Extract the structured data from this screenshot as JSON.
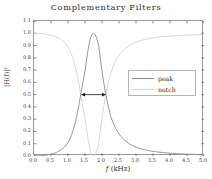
{
  "chart_data": {
    "type": "line",
    "title": "Complementary Filters",
    "xlabel_italic": "f",
    "xlabel_rest": " (kHz)",
    "xlabel": "f (kHz)",
    "ylabel": "|H(f)|²",
    "xlim": [
      0.0,
      5.0
    ],
    "ylim": [
      0.0,
      1.1
    ],
    "grid": false,
    "legend_position": "center right",
    "xticks": [
      "0.0",
      "0.5",
      "1.0",
      "1.5",
      "2.0",
      "2.5",
      "3.0",
      "3.5",
      "4.0",
      "4.5",
      "5.0"
    ],
    "xtick_values": [
      0.0,
      0.5,
      1.0,
      1.5,
      2.0,
      2.5,
      3.0,
      3.5,
      4.0,
      4.5,
      5.0
    ],
    "yticks": [
      "0.0",
      "0.1",
      "0.2",
      "0.3",
      "0.4",
      "0.5",
      "0.6",
      "0.7",
      "0.8",
      "0.9",
      "1.0",
      "1.1"
    ],
    "ytick_values": [
      0.0,
      0.1,
      0.2,
      0.3,
      0.4,
      0.5,
      0.6,
      0.7,
      0.8,
      0.9,
      1.0,
      1.1
    ],
    "center_frequency": 1.75,
    "bandwidth": 0.5,
    "annotation": {
      "label": "bandwidth-arrow",
      "y": 0.5,
      "x_start": 1.5,
      "x_end": 2.0,
      "style": "double-headed-arrow",
      "color": "#1a1a1a"
    },
    "series": [
      {
        "name": "peak",
        "color": "#8c8c8c",
        "x": [
          0.0,
          0.1,
          0.2,
          0.3,
          0.4,
          0.5,
          0.6,
          0.7,
          0.8,
          0.9,
          1.0,
          1.05,
          1.1,
          1.15,
          1.2,
          1.25,
          1.3,
          1.35,
          1.4,
          1.45,
          1.5,
          1.55,
          1.6,
          1.65,
          1.7,
          1.75,
          1.8,
          1.85,
          1.9,
          1.95,
          2.0,
          2.05,
          2.1,
          2.15,
          2.2,
          2.25,
          2.3,
          2.35,
          2.4,
          2.5,
          2.6,
          2.7,
          2.8,
          2.9,
          3.0,
          3.2,
          3.4,
          3.6,
          3.8,
          4.0,
          4.25,
          4.5,
          4.75,
          5.0
        ],
        "values": [
          0.0,
          0.001,
          0.002,
          0.005,
          0.009,
          0.015,
          0.023,
          0.035,
          0.051,
          0.074,
          0.111,
          0.136,
          0.168,
          0.208,
          0.257,
          0.316,
          0.385,
          0.461,
          0.542,
          0.62,
          0.69,
          0.79,
          0.88,
          0.95,
          0.99,
          1.0,
          0.99,
          0.955,
          0.9,
          0.8,
          0.69,
          0.6,
          0.52,
          0.45,
          0.385,
          0.33,
          0.29,
          0.255,
          0.225,
          0.18,
          0.145,
          0.12,
          0.1,
          0.085,
          0.072,
          0.054,
          0.042,
          0.034,
          0.028,
          0.023,
          0.018,
          0.015,
          0.012,
          0.01
        ]
      },
      {
        "name": "notch",
        "color": "#d2d2d2",
        "x": [
          0.0,
          0.1,
          0.2,
          0.3,
          0.4,
          0.5,
          0.6,
          0.7,
          0.8,
          0.9,
          1.0,
          1.05,
          1.1,
          1.15,
          1.2,
          1.25,
          1.3,
          1.35,
          1.4,
          1.45,
          1.5,
          1.55,
          1.6,
          1.65,
          1.7,
          1.75,
          1.8,
          1.85,
          1.9,
          1.95,
          2.0,
          2.05,
          2.1,
          2.15,
          2.2,
          2.25,
          2.3,
          2.35,
          2.4,
          2.5,
          2.6,
          2.7,
          2.8,
          2.9,
          3.0,
          3.2,
          3.4,
          3.6,
          3.8,
          4.0,
          4.25,
          4.5,
          4.75,
          5.0
        ],
        "values": [
          1.0,
          0.999,
          0.998,
          0.995,
          0.991,
          0.985,
          0.977,
          0.965,
          0.949,
          0.926,
          0.889,
          0.864,
          0.832,
          0.792,
          0.743,
          0.684,
          0.615,
          0.539,
          0.458,
          0.38,
          0.31,
          0.21,
          0.12,
          0.05,
          0.01,
          0.0,
          0.01,
          0.045,
          0.1,
          0.2,
          0.31,
          0.4,
          0.48,
          0.55,
          0.615,
          0.67,
          0.71,
          0.745,
          0.775,
          0.82,
          0.855,
          0.88,
          0.9,
          0.915,
          0.928,
          0.946,
          0.958,
          0.966,
          0.972,
          0.977,
          0.982,
          0.985,
          0.988,
          0.99
        ]
      }
    ]
  },
  "legend": {
    "entries": [
      {
        "label": "peak",
        "color": "#8c8c8c"
      },
      {
        "label": "notch",
        "color": "#d2d2d2"
      }
    ]
  },
  "style": {
    "frame_color": "#9a9a9a",
    "tick_color": "#3a3a3a",
    "background": "#ffffff"
  }
}
